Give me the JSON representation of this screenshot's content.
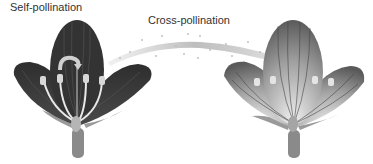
{
  "labels": {
    "self": "Self-pollination",
    "cross": "Cross-pollination"
  },
  "flowers": [
    {
      "id": "left-flower",
      "style": "dark",
      "petal_color": "#3a3a3a",
      "stamens": 4,
      "pollination": "self"
    },
    {
      "id": "right-flower",
      "style": "light-gradient",
      "petal_color": "#8a8a8a",
      "stamens": 4,
      "pollination": "cross-recipient"
    }
  ],
  "colors": {
    "background": "#ffffff",
    "text": "#333333",
    "dark_petal": "#3a3a3a",
    "light_petal_edge": "#6a6a6a",
    "light_petal_center": "#e6e6e6",
    "stem": "#8a8a8a"
  }
}
